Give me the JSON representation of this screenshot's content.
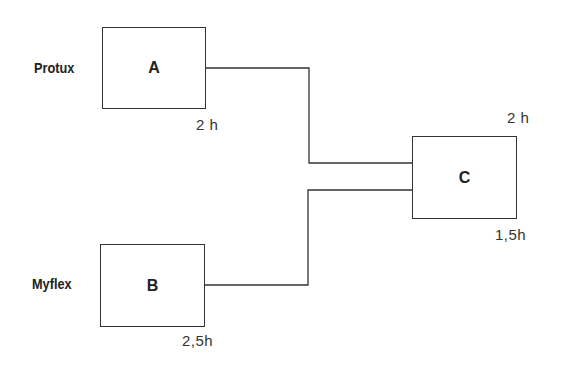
{
  "diagram": {
    "nodes": [
      {
        "id": "A",
        "label": "A",
        "name": "Protux",
        "duration": "2 h"
      },
      {
        "id": "B",
        "label": "B",
        "name": "Myflex",
        "duration": "2,5h"
      },
      {
        "id": "C",
        "label": "C",
        "duration_top": "2 h",
        "duration_bottom": "1,5h"
      }
    ],
    "edges": [
      {
        "from": "A",
        "to": "C"
      },
      {
        "from": "B",
        "to": "C"
      }
    ]
  }
}
